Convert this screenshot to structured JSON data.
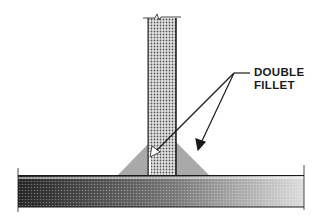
{
  "diagram": {
    "callout": {
      "line1": "DOUBLE",
      "line2": "FILLET"
    },
    "colors": {
      "fillet": "#a8a8a8",
      "plate_light": "#d8d8d8",
      "plate_dark": "#3a3a3a",
      "line": "#1a1a1a"
    }
  }
}
